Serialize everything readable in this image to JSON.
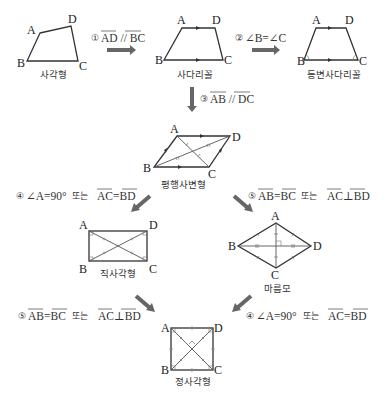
{
  "diagram": {
    "colors": {
      "line": "#333333",
      "arrow": "#666666",
      "text": "#222222"
    },
    "shapes": [
      {
        "id": "quadrilateral",
        "name": "사각형",
        "vertices": [
          "A",
          "B",
          "C",
          "D"
        ]
      },
      {
        "id": "trapezoid",
        "name": "사다리꼴",
        "vertices": [
          "A",
          "B",
          "C",
          "D"
        ]
      },
      {
        "id": "isosceles_trapezoid",
        "name": "등변사다리꼴",
        "vertices": [
          "A",
          "B",
          "C",
          "D"
        ]
      },
      {
        "id": "parallelogram",
        "name": "평행사변형",
        "vertices": [
          "A",
          "B",
          "C",
          "D"
        ]
      },
      {
        "id": "rectangle",
        "name": "직사각형",
        "vertices": [
          "A",
          "B",
          "C",
          "D"
        ]
      },
      {
        "id": "rhombus",
        "name": "마름모",
        "vertices": [
          "A",
          "B",
          "C",
          "D"
        ]
      },
      {
        "id": "square",
        "name": "정사각형",
        "vertices": [
          "A",
          "B",
          "C",
          "D"
        ]
      }
    ],
    "conditions": {
      "c1": {
        "num": "①",
        "text": "AD // BC"
      },
      "c2": {
        "num": "②",
        "text": "∠B=∠C"
      },
      "c3": {
        "num": "③",
        "text": "AB // DC"
      },
      "c4_left": {
        "num": "④",
        "angle": "∠A=90°",
        "or": "또는",
        "eq": "AC=BD"
      },
      "c5_right": {
        "num": "⑤",
        "eq1": "AB=BC",
        "or": "또는",
        "eq2": "AC⊥BD"
      },
      "c5_left": {
        "num": "⑤",
        "eq1": "AB=BC",
        "or": "또는",
        "eq2": "AC⊥BD"
      },
      "c4_right": {
        "num": "④",
        "angle": "∠A=90°",
        "or": "또는",
        "eq": "AC=BD"
      }
    },
    "edges": [
      {
        "from": "quadrilateral",
        "to": "trapezoid",
        "condition": "c1"
      },
      {
        "from": "trapezoid",
        "to": "isosceles_trapezoid",
        "condition": "c2"
      },
      {
        "from": "trapezoid",
        "to": "parallelogram",
        "condition": "c3"
      },
      {
        "from": "parallelogram",
        "to": "rectangle",
        "condition": "c4_left"
      },
      {
        "from": "parallelogram",
        "to": "rhombus",
        "condition": "c5_right"
      },
      {
        "from": "rectangle",
        "to": "square",
        "condition": "c5_left"
      },
      {
        "from": "rhombus",
        "to": "square",
        "condition": "c4_right"
      }
    ],
    "labels": {
      "A": "A",
      "B": "B",
      "C": "C",
      "D": "D"
    }
  }
}
